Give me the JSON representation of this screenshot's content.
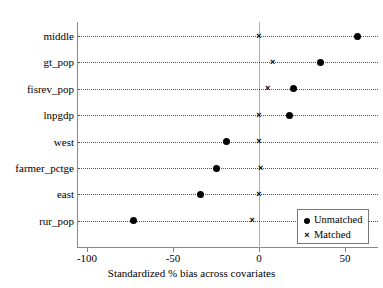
{
  "chart_data": {
    "type": "scatter",
    "title": "",
    "xlabel": "Standardized % bias across covariates",
    "ylabel": "",
    "xlim": [
      -115,
      70
    ],
    "xticks": [
      -100,
      -50,
      0,
      50
    ],
    "xticklabels": [
      "-100",
      "-50",
      "0",
      "50"
    ],
    "categories": [
      "middle",
      "gt_pop",
      "fisrev_pop",
      "lnpgdp",
      "west",
      "farmer_pctge",
      "east",
      "rur_pop"
    ],
    "grid": "dotted-horizontal",
    "reference_line": 0,
    "legend": {
      "position": "bottom-right",
      "entries": [
        {
          "label": "Unmatched",
          "glyph": "filled-circle"
        },
        {
          "label": "Matched",
          "glyph": "cross-x"
        }
      ]
    },
    "series": [
      {
        "name": "Unmatched",
        "marker": "filled-circle",
        "values": [
          57,
          36,
          20,
          18,
          -19,
          -25,
          -34,
          -73
        ]
      },
      {
        "name": "Matched",
        "marker": "cross-x",
        "values": [
          0,
          8,
          5,
          0,
          0,
          1,
          0,
          -4
        ]
      }
    ]
  },
  "colors": {
    "marker": "#000000",
    "axis": "#8a8a8a",
    "reference_line": "#b0b0b0",
    "grid": "#555555",
    "legend_border": "#777777",
    "background": "#ffffff"
  }
}
